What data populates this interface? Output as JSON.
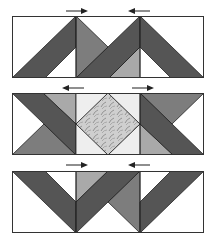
{
  "diagram": {
    "type": "quilt-block-assembly",
    "rows": [
      {
        "name": "row-1",
        "arrows": [
          {
            "x": 64,
            "direction": "right"
          },
          {
            "x": 128,
            "direction": "left"
          }
        ]
      },
      {
        "name": "row-2",
        "arrows": [
          {
            "x": 64,
            "direction": "left"
          },
          {
            "x": 128,
            "direction": "right"
          }
        ]
      },
      {
        "name": "row-3",
        "arrows": [
          {
            "x": 64,
            "direction": "right"
          },
          {
            "x": 128,
            "direction": "left"
          }
        ]
      }
    ],
    "colors": {
      "dark": "#555555",
      "medium": "#7d7d7d",
      "light": "#a9a9a9",
      "background": "#ffffff",
      "center_bg": "#eeeeee",
      "print": "#c8c8c8",
      "outline": "#222222"
    }
  }
}
